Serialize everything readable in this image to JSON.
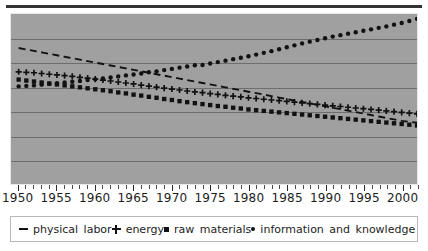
{
  "chart_data": {
    "type": "line",
    "title": "",
    "subtitle": "",
    "xlabel": "",
    "ylabel": "",
    "xlim": [
      1949,
      2002
    ],
    "ylim": [
      0,
      7
    ],
    "grid": true,
    "gridlines_y": [
      1,
      2,
      3,
      4,
      5,
      6
    ],
    "legend_position": "bottom",
    "x": [
      1950,
      1951,
      1952,
      1953,
      1954,
      1955,
      1956,
      1957,
      1958,
      1959,
      1960,
      1961,
      1962,
      1963,
      1964,
      1965,
      1966,
      1967,
      1968,
      1969,
      1970,
      1971,
      1972,
      1973,
      1974,
      1975,
      1976,
      1977,
      1978,
      1979,
      1980,
      1981,
      1982,
      1983,
      1984,
      1985,
      1986,
      1987,
      1988,
      1989,
      1990,
      1991,
      1992,
      1993,
      1994,
      1995,
      1996,
      1997,
      1998,
      1999,
      2000,
      2001,
      2002
    ],
    "tick_labels": [
      "1950",
      "1955",
      "1960",
      "1965",
      "1970",
      "1975",
      "1980",
      "1985",
      "1990",
      "1995",
      "2000"
    ],
    "tick_label_years": [
      1950,
      1955,
      1960,
      1965,
      1970,
      1975,
      1980,
      1985,
      1990,
      1995,
      2000
    ],
    "minor_tick_interval": 1,
    "series": [
      {
        "name": "physical labor",
        "marker": "dash",
        "style": "dashed",
        "color": "#111111",
        "values": [
          5.6,
          5.54,
          5.48,
          5.42,
          5.36,
          5.3,
          5.24,
          5.18,
          5.12,
          5.06,
          5.0,
          4.94,
          4.88,
          4.82,
          4.76,
          4.7,
          4.64,
          4.58,
          4.52,
          4.46,
          4.4,
          4.34,
          4.28,
          4.22,
          4.16,
          4.1,
          4.04,
          3.98,
          3.92,
          3.86,
          3.8,
          3.74,
          3.68,
          3.62,
          3.56,
          3.5,
          3.44,
          3.38,
          3.32,
          3.26,
          3.2,
          3.14,
          3.08,
          3.02,
          2.96,
          2.9,
          2.84,
          2.78,
          2.72,
          2.66,
          2.6,
          2.56,
          2.52
        ]
      },
      {
        "name": "energy",
        "marker": "plus",
        "style": "markers",
        "color": "#111111",
        "values": [
          4.62,
          4.6,
          4.58,
          4.55,
          4.52,
          4.49,
          4.46,
          4.43,
          4.39,
          4.36,
          4.32,
          4.28,
          4.24,
          4.2,
          4.16,
          4.12,
          4.07,
          4.03,
          3.99,
          3.95,
          3.91,
          3.87,
          3.83,
          3.79,
          3.76,
          3.72,
          3.69,
          3.65,
          3.62,
          3.59,
          3.55,
          3.52,
          3.49,
          3.46,
          3.43,
          3.4,
          3.37,
          3.34,
          3.31,
          3.28,
          3.25,
          3.22,
          3.19,
          3.16,
          3.13,
          3.1,
          3.07,
          3.04,
          3.01,
          2.98,
          2.95,
          2.92,
          2.89
        ]
      },
      {
        "name": "raw materials",
        "marker": "square",
        "style": "markers",
        "color": "#111111",
        "values": [
          4.3,
          4.26,
          4.22,
          4.18,
          4.14,
          4.1,
          4.06,
          4.02,
          3.98,
          3.94,
          3.9,
          3.86,
          3.82,
          3.77,
          3.73,
          3.68,
          3.64,
          3.59,
          3.55,
          3.5,
          3.46,
          3.41,
          3.37,
          3.33,
          3.29,
          3.25,
          3.21,
          3.18,
          3.14,
          3.11,
          3.07,
          3.04,
          3.01,
          2.98,
          2.95,
          2.92,
          2.89,
          2.86,
          2.83,
          2.8,
          2.77,
          2.74,
          2.71,
          2.68,
          2.65,
          2.62,
          2.59,
          2.56,
          2.53,
          2.5,
          2.47,
          2.44,
          2.41
        ]
      },
      {
        "name": "information and knowledge",
        "marker": "dot",
        "style": "markers",
        "color": "#111111",
        "values": [
          4.02,
          4.04,
          4.06,
          4.09,
          4.12,
          4.15,
          4.18,
          4.21,
          4.24,
          4.28,
          4.31,
          4.35,
          4.39,
          4.43,
          4.47,
          4.51,
          4.55,
          4.6,
          4.64,
          4.69,
          4.74,
          4.79,
          4.84,
          4.89,
          4.9,
          4.96,
          5.02,
          5.08,
          5.14,
          5.2,
          5.26,
          5.33,
          5.4,
          5.47,
          5.55,
          5.63,
          5.71,
          5.79,
          5.86,
          5.93,
          6.0,
          6.07,
          6.13,
          6.19,
          6.25,
          6.31,
          6.37,
          6.43,
          6.49,
          6.56,
          6.63,
          6.71,
          6.8
        ]
      }
    ]
  },
  "legend": {
    "items": [
      {
        "label": "physical labor",
        "marker": "dash-marker"
      },
      {
        "label": "energy",
        "marker": "plus-marker"
      },
      {
        "label": "raw materials",
        "marker": "square-marker"
      },
      {
        "label": "information and knowledge",
        "marker": "dot-marker"
      }
    ]
  },
  "colors": {
    "plot_background": "#a0a0a0",
    "gridline": "#6e6e6e",
    "ink": "#111111",
    "legend_background": "#ffffff",
    "top_rule": "#333333"
  }
}
